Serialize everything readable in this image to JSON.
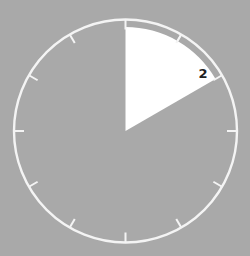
{
  "timer": {
    "value_label": "2",
    "elapsed_degrees": 60,
    "tick_count": 12,
    "colors": {
      "background": "#a9a9a9",
      "dial_ring": "#f4f4f4",
      "wedge_fill": "#ffffff",
      "wedge_band": "#a9a9a9",
      "label": "#222222"
    }
  }
}
